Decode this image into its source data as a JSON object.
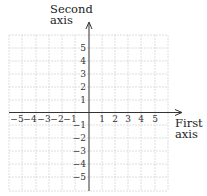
{
  "diagram": {
    "type": "coordinate-plane",
    "y_axis_label": [
      "Second",
      "axis"
    ],
    "x_axis_label": [
      "First",
      "axis"
    ],
    "x_ticks": {
      "negative": [
        "−5",
        "−4",
        "−3",
        "−2",
        "−1"
      ],
      "positive": [
        "1",
        "2",
        "3",
        "4",
        "5"
      ]
    },
    "y_ticks": {
      "positive": [
        "5",
        "4",
        "3",
        "2",
        "1"
      ],
      "negative": [
        "−1",
        "−2",
        "−3",
        "−4",
        "−5"
      ]
    },
    "grid": {
      "x_range": [
        -6,
        6
      ],
      "y_range": [
        -6,
        6
      ],
      "cell_px": 13.2
    },
    "colors": {
      "axis": "#333333",
      "grid": "#d6d6d6",
      "text": "#222222"
    }
  }
}
